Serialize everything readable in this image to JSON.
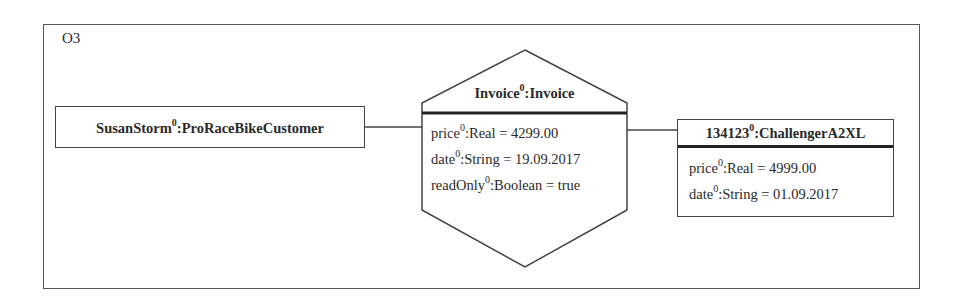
{
  "diagram": {
    "frame_label": "O3",
    "objects": [
      {
        "id": "customer",
        "name": "SusanStorm",
        "marker": "0",
        "type": "ProRaceBikeCustomer",
        "shape": "rectangle",
        "attributes": []
      },
      {
        "id": "invoice",
        "name": "Invoice",
        "marker": "0",
        "type": "Invoice",
        "shape": "hexagon",
        "attributes": [
          {
            "name": "price",
            "marker": "0",
            "type": "Real",
            "value": "4299.00"
          },
          {
            "name": "date",
            "marker": "0",
            "type": "String",
            "value": "19.09.2017"
          },
          {
            "name": "readOnly",
            "marker": "0",
            "type": "Boolean",
            "value": "true"
          }
        ]
      },
      {
        "id": "bike",
        "name": "134123",
        "marker": "0",
        "type": "ChallengerA2XL",
        "shape": "rectangle",
        "attributes": [
          {
            "name": "price",
            "marker": "0",
            "type": "Real",
            "value": "4999.00"
          },
          {
            "name": "date",
            "marker": "0",
            "type": "String",
            "value": "01.09.2017"
          }
        ]
      }
    ],
    "links": [
      {
        "from": "customer",
        "to": "invoice"
      },
      {
        "from": "invoice",
        "to": "bike"
      }
    ],
    "colors": {
      "stroke": "#444444",
      "text": "#2a2a2a",
      "background": "#ffffff"
    }
  }
}
